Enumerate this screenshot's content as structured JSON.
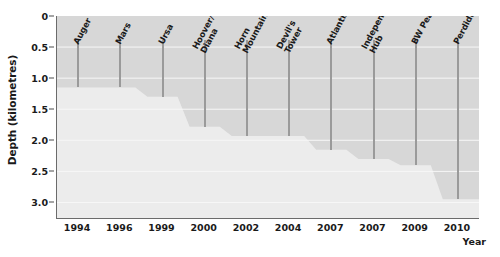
{
  "chart_data": {
    "type": "area",
    "title": "",
    "subtitle": "",
    "xlabel": "Year",
    "ylabel": "Depth (kilometres)",
    "ylim": [
      0,
      3.25
    ],
    "y_inverted": true,
    "grid": true,
    "legend": null,
    "y_ticks": [
      {
        "value": 0,
        "label": "0"
      },
      {
        "value": 0.5,
        "label": "0.5"
      },
      {
        "value": 1.0,
        "label": "1.0"
      },
      {
        "value": 1.5,
        "label": "1.5"
      },
      {
        "value": 2.0,
        "label": "2.0"
      },
      {
        "value": 2.5,
        "label": "2.5"
      },
      {
        "value": 3.0,
        "label": "3.0"
      }
    ],
    "categories": [
      "1994",
      "1996",
      "1999",
      "2000",
      "2002",
      "2004",
      "2007",
      "2007",
      "2009",
      "2010"
    ],
    "series": [
      {
        "name": "Record water depth of offshore platform",
        "values": [
          1.15,
          1.15,
          1.3,
          1.78,
          1.93,
          1.93,
          2.15,
          2.3,
          2.4,
          2.95
        ]
      }
    ],
    "annotations": [
      {
        "label": "Auger",
        "year": "1994",
        "depth": 1.15
      },
      {
        "label": "Mars",
        "year": "1996",
        "depth": 1.15
      },
      {
        "label": "Ursa",
        "year": "1999",
        "depth": 1.3
      },
      {
        "label": "Hoover/\nDiana",
        "year": "2000",
        "depth": 1.78
      },
      {
        "label": "Horn\nMountain",
        "year": "2002",
        "depth": 1.93
      },
      {
        "label": "Devil's\nTower",
        "year": "2004",
        "depth": 1.93
      },
      {
        "label": "Atlantis",
        "year": "2007",
        "depth": 2.15
      },
      {
        "label": "Independence\nHub",
        "year": "2007",
        "depth": 2.3
      },
      {
        "label": "BW Peace",
        "year": "2009",
        "depth": 2.4
      },
      {
        "label": "Perdido",
        "year": "2010",
        "depth": 2.95
      }
    ],
    "colors": {
      "plot_background": "#e9e9e9",
      "water_fill": "#d7d7d7",
      "seafloor_fill": "#ececec",
      "gridline": "#f6f6f6",
      "marker_line": "#9a9a9a",
      "axis": "#6b6b6b",
      "text": "#1a1a1a"
    }
  }
}
